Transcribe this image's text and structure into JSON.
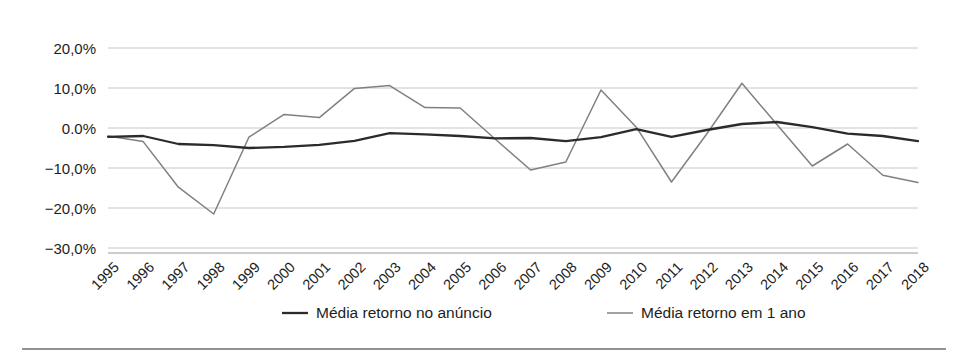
{
  "chart_data": {
    "type": "line",
    "title": "",
    "xlabel": "",
    "ylabel": "",
    "ylim": [
      -30,
      20
    ],
    "ytick_labels": [
      "20,0%",
      "10,0%",
      "0.0%",
      "−10,0%",
      "−20,0%",
      "−30,0%"
    ],
    "yticks": [
      20,
      10,
      0,
      -10,
      -20,
      -30
    ],
    "grid": true,
    "legend_position": "bottom",
    "categories": [
      "1995",
      "1996",
      "1997",
      "1998",
      "1999",
      "2000",
      "2001",
      "2002",
      "2003",
      "2004",
      "2005",
      "2006",
      "2007",
      "2008",
      "2009",
      "2010",
      "2011",
      "2012",
      "2013",
      "2014",
      "2015",
      "2016",
      "2017",
      "2018"
    ],
    "series": [
      {
        "name": "Média retorno no anúncio",
        "color": "#2b2b2b",
        "values": [
          -2.2,
          -2.0,
          -4.0,
          -4.3,
          -5.0,
          -4.7,
          -4.2,
          -3.2,
          -1.3,
          -1.6,
          -2.0,
          -2.6,
          -2.5,
          -3.3,
          -2.3,
          -0.3,
          -2.2,
          -0.5,
          1.0,
          1.5,
          0.2,
          -1.4,
          -2.0,
          -3.3
        ]
      },
      {
        "name": "Média retorno em 1 ano",
        "color": "#808080",
        "values": [
          -2.0,
          -3.4,
          -14.8,
          -21.5,
          -2.3,
          3.4,
          2.6,
          9.9,
          10.6,
          5.1,
          5.0,
          -2.8,
          -10.5,
          -8.5,
          9.5,
          0.2,
          -13.5,
          -1.5,
          11.2,
          0.8,
          -9.5,
          -4.0,
          -11.8,
          -13.6
        ]
      }
    ]
  },
  "legend": {
    "items": [
      {
        "label": "Média retorno no anúncio",
        "color": "#2b2b2b"
      },
      {
        "label": "Média retorno em 1 ano",
        "color": "#8a8a8a"
      }
    ]
  },
  "colors": {
    "background": "#ffffff",
    "grid": "#c8c8c8",
    "axis": "#9a9a9a",
    "series_dark": "#2b2b2b",
    "series_light": "#808080",
    "text": "#1d1d1d",
    "footer_rule": "#6f6f6f"
  }
}
